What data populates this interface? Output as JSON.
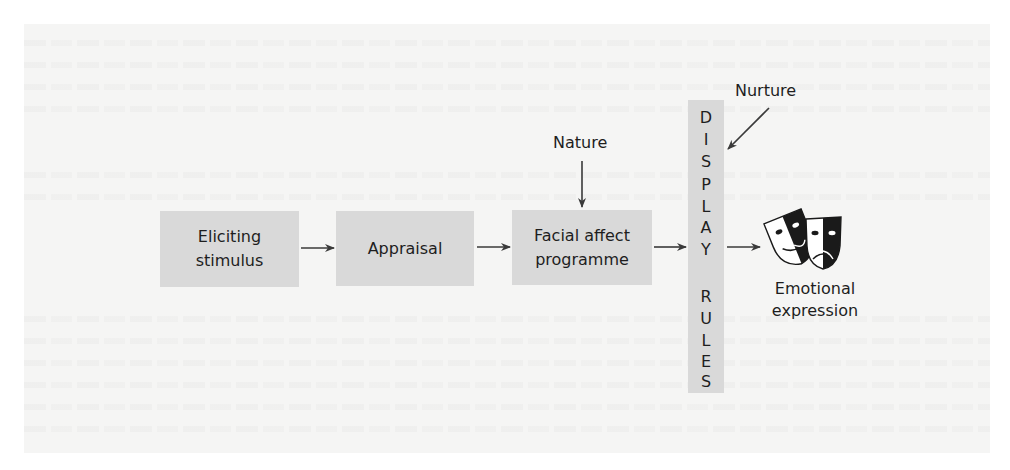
{
  "diagram": {
    "boxes": [
      {
        "id": "eliciting-stimulus",
        "lines": [
          "Eliciting",
          "stimulus"
        ]
      },
      {
        "id": "appraisal",
        "lines": [
          "Appraisal"
        ]
      },
      {
        "id": "facial-affect-programme",
        "lines": [
          "Facial affect",
          "programme"
        ]
      }
    ],
    "display_rules": {
      "letters": [
        "D",
        "I",
        "S",
        "P",
        "L",
        "A",
        "Y",
        "",
        "R",
        "U",
        "L",
        "E",
        "S"
      ],
      "text": "DISPLAY RULES"
    },
    "inputs": {
      "nature": "Nature",
      "nurture": "Nurture"
    },
    "output": {
      "icon": "theatre-masks-icon",
      "lines": [
        "Emotional",
        "expression"
      ]
    },
    "colors": {
      "box_fill": "#d9d9d9",
      "panel": "#f5f5f4",
      "arrow": "#3a3a3a",
      "text": "#1e1e1e"
    }
  }
}
